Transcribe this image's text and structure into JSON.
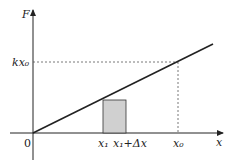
{
  "diagram": {
    "y_axis_label": "F",
    "x_axis_label": "x",
    "origin_label": "0",
    "y_mark_label": "kx₀",
    "x_labels": [
      "x₁",
      "x₁+Δx",
      "x₀"
    ],
    "colors": {
      "line": "#222222",
      "rect_fill": "#d0d0d0",
      "dash": "#555555"
    }
  }
}
